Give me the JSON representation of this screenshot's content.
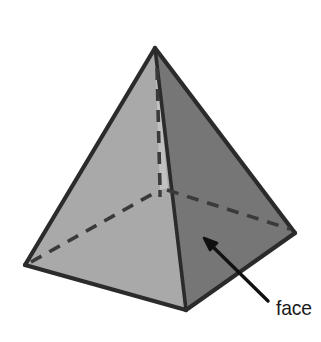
{
  "figure": {
    "name": "square-pyramid-diagram",
    "background_color": "#ffffff",
    "outline_color": "#2b2b2b",
    "annotation": {
      "label": "face",
      "label_color": "#1a1a1a",
      "arrow_color": "#111111",
      "arrow_tail": {
        "x": 268,
        "y": 300
      },
      "arrow_tip": {
        "x": 205,
        "y": 239
      },
      "points_to": "front-right-lateral-face"
    },
    "vertices": {
      "apex": {
        "x": 155,
        "y": 48
      },
      "base_left": {
        "x": 25,
        "y": 265
      },
      "base_front": {
        "x": 186,
        "y": 310
      },
      "base_right": {
        "x": 295,
        "y": 233
      },
      "base_back_hidden": {
        "x": 160,
        "y": 190
      }
    },
    "faces": [
      {
        "name": "front-left-lateral-face",
        "fill": "#a9a9a9",
        "visible": true,
        "vertices": [
          "apex",
          "base_left",
          "base_front"
        ]
      },
      {
        "name": "front-right-lateral-face",
        "fill": "#767676",
        "visible": true,
        "vertices": [
          "apex",
          "base_front",
          "base_right"
        ]
      },
      {
        "name": "back-right-lateral-face",
        "fill": "#a9a9a9",
        "visible": false,
        "vertices": [
          "apex",
          "base_right",
          "base_back_hidden"
        ]
      },
      {
        "name": "back-left-lateral-face",
        "fill": "#b0b0b0",
        "visible": false,
        "vertices": [
          "apex",
          "base_back_hidden",
          "base_left"
        ]
      }
    ],
    "edges": [
      {
        "name": "edge-apex-to-base-left",
        "style": "solid",
        "from": "apex",
        "to": "base_left"
      },
      {
        "name": "edge-apex-to-base-front",
        "style": "solid",
        "from": "apex",
        "to": "base_front"
      },
      {
        "name": "edge-apex-to-base-right",
        "style": "solid",
        "from": "apex",
        "to": "base_right"
      },
      {
        "name": "edge-base-left-to-base-front",
        "style": "solid",
        "from": "base_left",
        "to": "base_front"
      },
      {
        "name": "edge-base-front-to-base-right",
        "style": "solid",
        "from": "base_front",
        "to": "base_right"
      },
      {
        "name": "edge-apex-to-base-back-hidden",
        "style": "dashed",
        "from": "apex",
        "to": "base_back_hidden"
      },
      {
        "name": "edge-base-left-to-base-back-hidden",
        "style": "dashed",
        "from": "base_left",
        "to": "base_back_hidden"
      },
      {
        "name": "edge-base-back-hidden-to-base-right",
        "style": "dashed",
        "from": "base_back_hidden",
        "to": "base_right"
      }
    ]
  }
}
